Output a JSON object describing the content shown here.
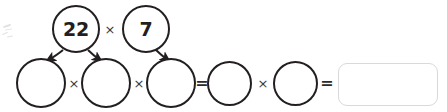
{
  "worksheet": {
    "title": "Factor tree multiplication worksheet",
    "ink_color": "#231f20",
    "operator_color": "#3a3a3c",
    "answer_box_border": "#d7d9dc",
    "background": "#ffffff"
  },
  "top_row": {
    "factors": [
      {
        "label": "22",
        "filled": true
      },
      {
        "label": "7",
        "filled": true
      }
    ],
    "operator": "×"
  },
  "bottom_row": {
    "blanks": [
      {
        "label": "",
        "filled": false
      },
      {
        "label": "",
        "filled": false
      },
      {
        "label": "",
        "filled": false
      },
      {
        "label": "",
        "filled": false
      },
      {
        "label": "",
        "filled": false
      }
    ],
    "operators": [
      {
        "symbol": "×",
        "kind": "times"
      },
      {
        "symbol": "×",
        "kind": "times"
      },
      {
        "symbol": "=",
        "kind": "equals"
      },
      {
        "symbol": "×",
        "kind": "times"
      },
      {
        "symbol": "=",
        "kind": "equals"
      }
    ]
  },
  "answer": {
    "value": "",
    "placeholder": ""
  },
  "arrows": [
    {
      "name": "arrow-22-to-blank-1",
      "from": "22",
      "to": "blank-1"
    },
    {
      "name": "arrow-22-to-blank-2",
      "from": "22",
      "to": "blank-2"
    },
    {
      "name": "arrow-7-to-blank-3",
      "from": "7",
      "to": "blank-3"
    }
  ]
}
